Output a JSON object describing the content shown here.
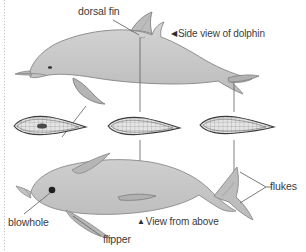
{
  "figure": {
    "background_color": "#ffffff",
    "body_fill": "#c9c9c9",
    "fin_fill": "#b5b5b5",
    "outline_color": "#6e6e6e",
    "leader_line_color": "#5a5a5a",
    "text_color": "#3b3b3b",
    "edge_rule_color": "#bdbdbd"
  },
  "labels": {
    "dorsal_fin": "dorsal fin",
    "side_view": "Side view of dolphin",
    "side_view_marker": "◀",
    "blowhole": "blowhole",
    "flipper": "flipper",
    "view_from_above": "View from above",
    "view_from_above_marker": "▲",
    "flukes": "flukes"
  },
  "views": {
    "side": {
      "name": "Side view of dolphin",
      "callouts": [
        "dorsal fin"
      ]
    },
    "above": {
      "name": "View from above",
      "callouts": [
        "blowhole",
        "flipper",
        "flukes"
      ]
    },
    "cross_sections": {
      "count": 3,
      "names": [
        "dorsal-fin-cross-section",
        "flipper-cross-section",
        "fluke-cross-section"
      ],
      "description": "hydrofoil cross sections with internal grid hatching"
    }
  }
}
